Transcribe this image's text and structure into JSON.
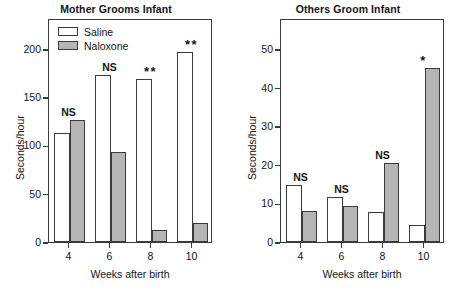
{
  "figure": {
    "caption_present": false
  },
  "legend": {
    "position": "top-left-inside-panel-1",
    "entries": [
      {
        "label": "Saline",
        "color": "#ffffff",
        "swatch": "open-box"
      },
      {
        "label": "Naloxone",
        "color": "#b5b5b5",
        "swatch": "gray-box"
      }
    ]
  },
  "chart_data": [
    {
      "type": "bar",
      "title": "Mother Grooms Infant",
      "xlabel": "Weeks after birth",
      "ylabel": "Seconds/hour",
      "categories": [
        "4",
        "6",
        "8",
        "10"
      ],
      "xticks": [
        "4",
        "6",
        "8",
        "10"
      ],
      "yticks": [
        0,
        50,
        100,
        150,
        200
      ],
      "ylim": [
        0,
        232
      ],
      "grid": false,
      "series": [
        {
          "name": "Saline",
          "color": "#ffffff",
          "values": [
            113,
            173,
            169,
            197
          ]
        },
        {
          "name": "Naloxone",
          "color": "#b5b5b5",
          "values": [
            126,
            93,
            12,
            20
          ]
        }
      ],
      "annotations": [
        {
          "category": "4",
          "text": "NS",
          "type": "text"
        },
        {
          "category": "6",
          "text": "NS",
          "type": "text"
        },
        {
          "category": "8",
          "text": "**",
          "type": "stars"
        },
        {
          "category": "10",
          "text": "**",
          "type": "stars"
        }
      ]
    },
    {
      "type": "bar",
      "title": "Others Groom Infant",
      "xlabel": "Weeks after birth",
      "ylabel": "Seconds/hour",
      "categories": [
        "4",
        "6",
        "8",
        "10"
      ],
      "xticks": [
        "4",
        "6",
        "8",
        "10"
      ],
      "yticks": [
        0,
        10,
        20,
        30,
        40,
        50
      ],
      "ylim": [
        0,
        58
      ],
      "grid": false,
      "series": [
        {
          "name": "Saline",
          "color": "#ffffff",
          "values": [
            14.7,
            11.6,
            7.7,
            4.4
          ]
        },
        {
          "name": "Naloxone",
          "color": "#b5b5b5",
          "values": [
            8.0,
            9.3,
            20.4,
            45.0
          ]
        }
      ],
      "annotations": [
        {
          "category": "4",
          "text": "NS",
          "type": "text"
        },
        {
          "category": "6",
          "text": "NS",
          "type": "text"
        },
        {
          "category": "8",
          "text": "NS",
          "type": "text"
        },
        {
          "category": "10",
          "text": "*",
          "type": "stars"
        }
      ]
    }
  ]
}
